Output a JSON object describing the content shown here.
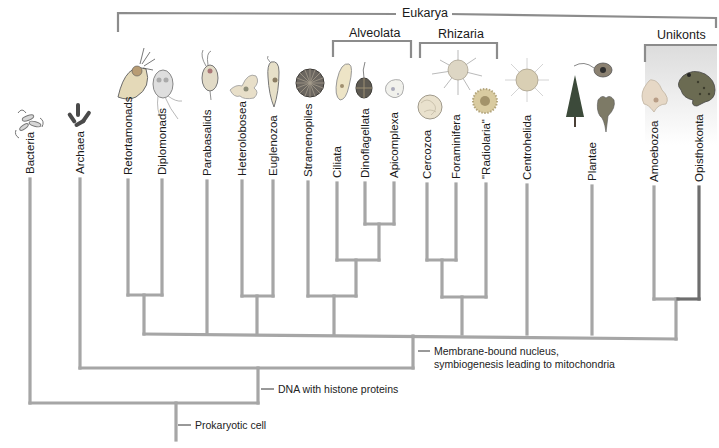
{
  "diagram": {
    "type": "phylogenetic-tree",
    "colors": {
      "branch": "#a6a6a6",
      "opisthokonta_branch": "#6e6e6e",
      "bracket": "#8c8c8c",
      "unikonts_bg": "#e4e4e4"
    },
    "groups": {
      "eukarya": "Eukarya",
      "alveolata": "Alveolata",
      "rhizaria": "Rhizaria",
      "unikonts": "Unikonts"
    },
    "taxa": [
      {
        "name": "Bacteria"
      },
      {
        "name": "Archaea"
      },
      {
        "name": "Retortamonads"
      },
      {
        "name": "Diplomonads"
      },
      {
        "name": "Parabasalids"
      },
      {
        "name": "Heterolobosea"
      },
      {
        "name": "Euglenozoa"
      },
      {
        "name": "Stramenopiles"
      },
      {
        "name": "Ciliata"
      },
      {
        "name": "Dinoflagellata"
      },
      {
        "name": "Apicomplexa"
      },
      {
        "name": "Cercozoa"
      },
      {
        "name": "Foraminifera"
      },
      {
        "name": "\"Radiolaria\""
      },
      {
        "name": "Centrohelida"
      },
      {
        "name": "Plantae"
      },
      {
        "name": "Amoebozoa"
      },
      {
        "name": "Opisthokonta"
      }
    ],
    "nodes": {
      "eukarya_node": {
        "line1": "Membrane-bound nucleus,",
        "line2": "symbiogenesis leading to mitochondria"
      },
      "histone_node": "DNA with histone proteins",
      "root_node": "Prokaryotic cell"
    }
  }
}
